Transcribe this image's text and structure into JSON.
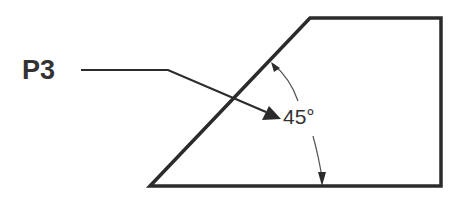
{
  "diagram": {
    "callout_label": "P3",
    "angle_label": "45°",
    "colors": {
      "stroke": "#2b2b2b",
      "text": "#333333",
      "background": "#ffffff"
    },
    "shape": "trapezoid-with-45-degree-chamfer"
  }
}
